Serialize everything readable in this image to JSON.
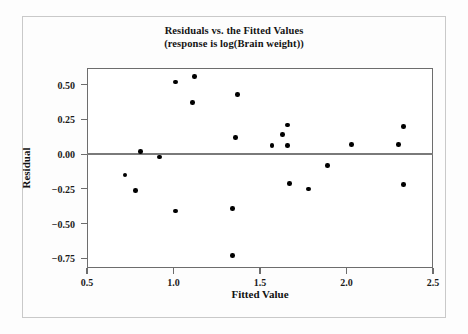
{
  "chart_data": {
    "type": "scatter",
    "title": "Residuals vs. the Fitted Values",
    "subtitle": "(response is log(Brain weight))",
    "xlabel": "Fitted Value",
    "ylabel": "Residual",
    "xlim": [
      0.5,
      2.5
    ],
    "ylim": [
      -0.82,
      0.62
    ],
    "xticks": [
      0.5,
      1.0,
      1.5,
      2.0,
      2.5
    ],
    "xtick_labels": [
      "0.5",
      "1.0",
      "1.5",
      "2.0",
      "2.5"
    ],
    "yticks": [
      0.5,
      0.25,
      0.0,
      -0.25,
      -0.5,
      -0.75
    ],
    "ytick_labels": [
      "0.50",
      "0.25",
      "0.00",
      "-0.25",
      "-0.50",
      "-0.75"
    ],
    "grid": false,
    "legend": "none",
    "reference_line": {
      "orientation": "horizontal",
      "y": 0.0,
      "color": "#7a7a7a"
    },
    "marker": {
      "shape": "circle",
      "color": "#000000",
      "size": 4.6
    },
    "points": [
      {
        "x": 0.72,
        "y": -0.15
      },
      {
        "x": 0.78,
        "y": -0.26
      },
      {
        "x": 0.81,
        "y": 0.02
      },
      {
        "x": 0.92,
        "y": -0.02
      },
      {
        "x": 1.01,
        "y": 0.52
      },
      {
        "x": 1.01,
        "y": -0.41
      },
      {
        "x": 1.11,
        "y": 0.37
      },
      {
        "x": 1.12,
        "y": 0.56
      },
      {
        "x": 1.34,
        "y": -0.73
      },
      {
        "x": 1.34,
        "y": -0.39
      },
      {
        "x": 1.36,
        "y": 0.12
      },
      {
        "x": 1.37,
        "y": 0.43
      },
      {
        "x": 1.57,
        "y": 0.06
      },
      {
        "x": 1.63,
        "y": 0.14
      },
      {
        "x": 1.66,
        "y": 0.21
      },
      {
        "x": 1.66,
        "y": 0.06
      },
      {
        "x": 1.67,
        "y": -0.21
      },
      {
        "x": 1.78,
        "y": -0.25
      },
      {
        "x": 1.89,
        "y": -0.08
      },
      {
        "x": 2.03,
        "y": 0.07
      },
      {
        "x": 2.3,
        "y": 0.07
      },
      {
        "x": 2.33,
        "y": 0.2
      },
      {
        "x": 2.33,
        "y": -0.22
      }
    ]
  },
  "figure": {
    "title_line1": "Residuals vs. the Fitted Values",
    "title_line2": "(response is log(Brain weight))",
    "x_axis_title": "Fitted Value",
    "y_axis_title": "Residual"
  }
}
